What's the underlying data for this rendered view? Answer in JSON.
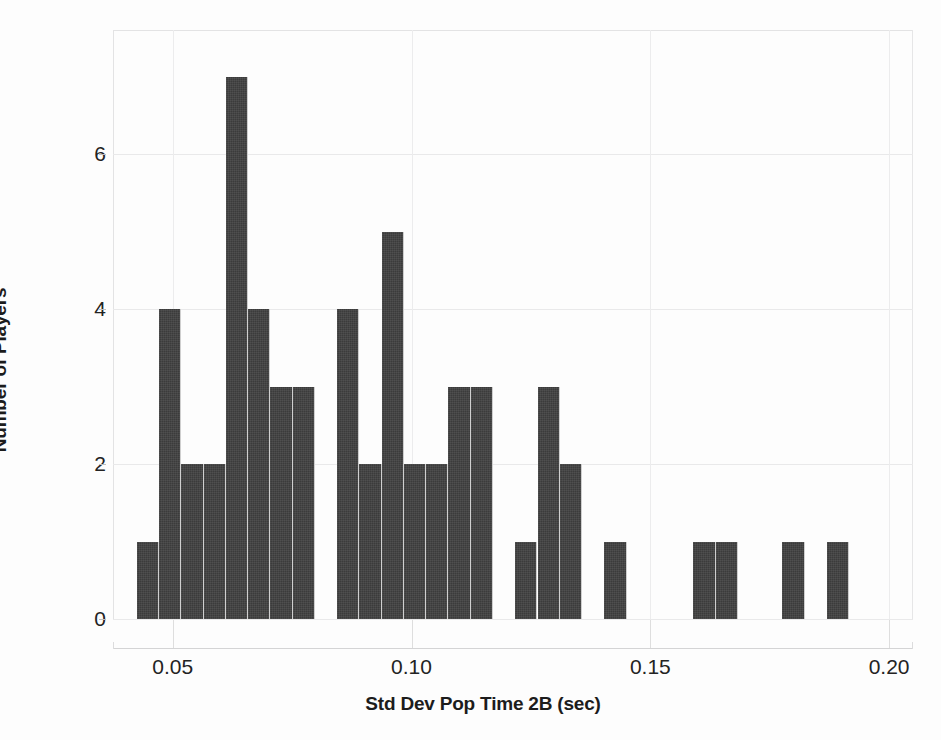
{
  "chart_data": {
    "type": "bar",
    "title": "",
    "subtitle": "",
    "xlabel": "Std Dev Pop Time 2B (sec)",
    "ylabel": "Number of Players",
    "xlim": [
      0.0375,
      0.205
    ],
    "ylim": [
      0,
      7.6
    ],
    "xticks": [
      "0.05",
      "0.10",
      "0.15",
      "0.20"
    ],
    "xtick_values": [
      0.05,
      0.1,
      0.15,
      0.2
    ],
    "yticks": [
      "0",
      "2",
      "4",
      "6"
    ],
    "ytick_values": [
      0,
      2,
      4,
      6
    ],
    "grid": "both",
    "legend": "none",
    "bin_width": 0.00466,
    "bar_color": "#3b3b3b",
    "grid_color": "#e9e9ea",
    "text_color": "#232323",
    "bins": [
      {
        "x0": 0.0425,
        "x1": 0.04716,
        "count": 1
      },
      {
        "x0": 0.04716,
        "x1": 0.05182,
        "count": 4
      },
      {
        "x0": 0.05182,
        "x1": 0.05648,
        "count": 2
      },
      {
        "x0": 0.05648,
        "x1": 0.06114,
        "count": 2
      },
      {
        "x0": 0.06114,
        "x1": 0.0658,
        "count": 7
      },
      {
        "x0": 0.0658,
        "x1": 0.07046,
        "count": 4
      },
      {
        "x0": 0.07046,
        "x1": 0.07512,
        "count": 3
      },
      {
        "x0": 0.07512,
        "x1": 0.07978,
        "count": 3
      },
      {
        "x0": 0.07978,
        "x1": 0.08444,
        "count": 0
      },
      {
        "x0": 0.08444,
        "x1": 0.0891,
        "count": 4
      },
      {
        "x0": 0.0891,
        "x1": 0.09376,
        "count": 2
      },
      {
        "x0": 0.09376,
        "x1": 0.09842,
        "count": 5
      },
      {
        "x0": 0.09842,
        "x1": 0.10308,
        "count": 2
      },
      {
        "x0": 0.10308,
        "x1": 0.10774,
        "count": 2
      },
      {
        "x0": 0.10774,
        "x1": 0.1124,
        "count": 3
      },
      {
        "x0": 0.1124,
        "x1": 0.11706,
        "count": 3
      },
      {
        "x0": 0.11706,
        "x1": 0.12172,
        "count": 0
      },
      {
        "x0": 0.12172,
        "x1": 0.12638,
        "count": 1
      },
      {
        "x0": 0.12638,
        "x1": 0.13104,
        "count": 3
      },
      {
        "x0": 0.13104,
        "x1": 0.1357,
        "count": 2
      },
      {
        "x0": 0.1357,
        "x1": 0.14036,
        "count": 0
      },
      {
        "x0": 0.14036,
        "x1": 0.14502,
        "count": 1
      },
      {
        "x0": 0.14502,
        "x1": 0.14968,
        "count": 0
      },
      {
        "x0": 0.14968,
        "x1": 0.15434,
        "count": 0
      },
      {
        "x0": 0.15434,
        "x1": 0.159,
        "count": 0
      },
      {
        "x0": 0.159,
        "x1": 0.16366,
        "count": 1
      },
      {
        "x0": 0.16366,
        "x1": 0.16832,
        "count": 1
      },
      {
        "x0": 0.16832,
        "x1": 0.17298,
        "count": 0
      },
      {
        "x0": 0.17298,
        "x1": 0.17764,
        "count": 0
      },
      {
        "x0": 0.17764,
        "x1": 0.1823,
        "count": 1
      },
      {
        "x0": 0.1823,
        "x1": 0.18696,
        "count": 0
      },
      {
        "x0": 0.18696,
        "x1": 0.19162,
        "count": 1
      }
    ],
    "total_count": 52,
    "max_count": 7
  }
}
